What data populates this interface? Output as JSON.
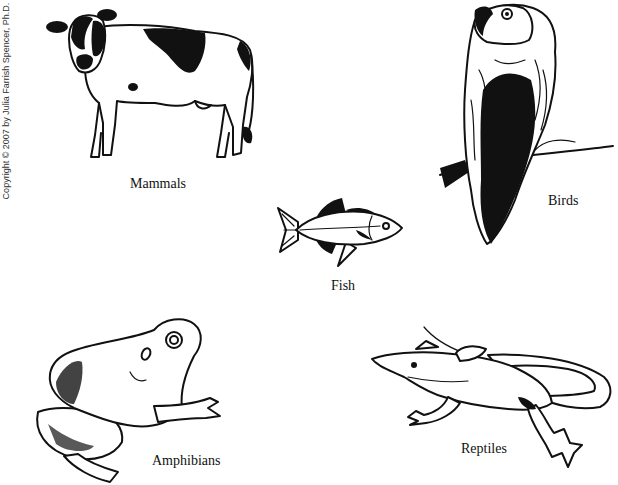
{
  "copyright": "Copyright © 2007 by Julia Farrish Spencer, Ph.D.",
  "groups": [
    {
      "id": "mammals",
      "label": "Mammals",
      "illustration": "cow-icon"
    },
    {
      "id": "birds",
      "label": "Birds",
      "illustration": "parrot-icon"
    },
    {
      "id": "fish",
      "label": "Fish",
      "illustration": "fish-icon"
    },
    {
      "id": "amphibians",
      "label": "Amphibians",
      "illustration": "frog-icon"
    },
    {
      "id": "reptiles",
      "label": "Reptiles",
      "illustration": "lizard-icon"
    }
  ],
  "colors": {
    "ink": "#111111",
    "background": "#ffffff"
  }
}
